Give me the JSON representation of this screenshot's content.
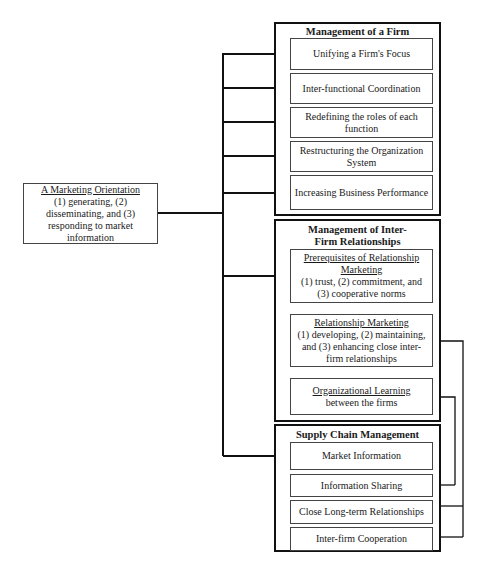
{
  "source": {
    "title": "A Marketing Orientation",
    "body": "(1) generating, (2) disseminating, and (3) responding to market information"
  },
  "groups": [
    {
      "title": "Management of a Firm",
      "items": [
        {
          "label": "Unifying a Firm's Focus"
        },
        {
          "label": "Inter-functional Coordination"
        },
        {
          "label": "Redefining the roles of each function"
        },
        {
          "label": "Restructuring the Organization System"
        },
        {
          "label": "Increasing Business Performance"
        }
      ]
    },
    {
      "title": "Management of Inter-Firm Relationships",
      "items": [
        {
          "title": "Prerequisites of Relationship Marketing",
          "body": "(1) trust, (2) commitment, and (3) cooperative norms"
        },
        {
          "title": "Relationship Marketing",
          "body": "(1) developing, (2) maintaining, and (3) enhancing close inter-firm relationships"
        },
        {
          "title": "Organizational Learning",
          "body": "between the firms"
        }
      ]
    },
    {
      "title": "Supply Chain Management",
      "items": [
        {
          "label": "Market Information"
        },
        {
          "label": "Information Sharing"
        },
        {
          "label": "Close Long-term Relationships"
        },
        {
          "label": "Inter-firm Cooperation"
        }
      ]
    }
  ],
  "colors": {
    "line": "#111111",
    "background": "#ffffff"
  }
}
